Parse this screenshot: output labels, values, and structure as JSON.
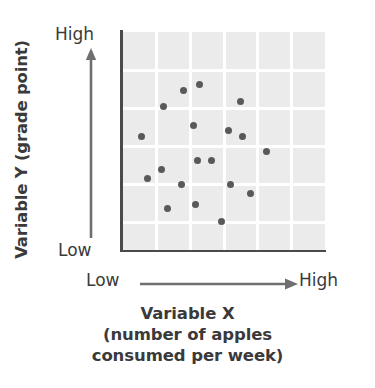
{
  "figure": {
    "kind": "scatter-plot-illustration",
    "background_color": "#ffffff",
    "plot_fill_color": "#ebebeb",
    "gridline_color": "#ffffff",
    "axis_color": "#4a4a4a",
    "point_color": "#595959",
    "text_color": "#3a3a3a"
  },
  "y_axis": {
    "title": "Variable Y (grade point)",
    "high_label": "High",
    "low_label": "Low",
    "arrow_icon": "arrow-up-icon"
  },
  "x_axis": {
    "low_label": "Low",
    "high_label": "High",
    "arrow_icon": "arrow-right-icon",
    "caption_lines": [
      "Variable X",
      "(number of apples",
      "consumed per week)"
    ]
  },
  "chart_data": {
    "type": "scatter",
    "title": "",
    "xlabel": "Variable X (number of apples consumed per week)",
    "ylabel": "Variable Y (grade point)",
    "xlim": [
      0,
      100
    ],
    "ylim": [
      0,
      100
    ],
    "xtick_labels": [
      "Low",
      "High"
    ],
    "ytick_labels": [
      "Low",
      "High"
    ],
    "grid": true,
    "grid_columns": 6,
    "grid_rows": 6,
    "legend": null,
    "annotation": "No apparent relationship between the two variables (zero correlation scatter).",
    "points": [
      {
        "x": 38,
        "y": 76
      },
      {
        "x": 30,
        "y": 73
      },
      {
        "x": 58,
        "y": 68
      },
      {
        "x": 20,
        "y": 66
      },
      {
        "x": 35,
        "y": 57
      },
      {
        "x": 52,
        "y": 55
      },
      {
        "x": 9,
        "y": 52
      },
      {
        "x": 59,
        "y": 52
      },
      {
        "x": 71,
        "y": 45
      },
      {
        "x": 37,
        "y": 41
      },
      {
        "x": 44,
        "y": 41
      },
      {
        "x": 19,
        "y": 37
      },
      {
        "x": 12,
        "y": 33
      },
      {
        "x": 29,
        "y": 30
      },
      {
        "x": 53,
        "y": 30
      },
      {
        "x": 63,
        "y": 26
      },
      {
        "x": 36,
        "y": 21
      },
      {
        "x": 22,
        "y": 19
      },
      {
        "x": 49,
        "y": 13
      }
    ]
  }
}
